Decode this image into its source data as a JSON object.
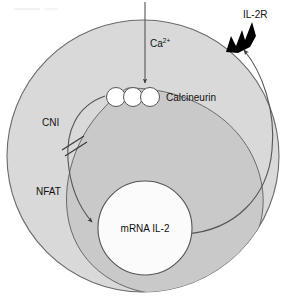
{
  "figure": {
    "background_color": "#ffffff",
    "line_color": "#555555",
    "text_color": "#111111"
  },
  "cell": {
    "name": "T lymphocyte",
    "cytoplasm_outer_color": "#d9d9d9",
    "cytoplasm_inner_color": "#c9c9c9",
    "membrane_color": "#6a6a6a"
  },
  "nucleus": {
    "label": "mRNA IL-2",
    "fill_color": "#fbfbfb",
    "border_color": "#555555"
  },
  "labels": {
    "calcium": "Ca",
    "calcium_superscript": "2+",
    "calcineurin": "Calcineurin",
    "cni": "CNI",
    "nfat": "NFAT",
    "il2r": "IL-2R"
  },
  "elements": {
    "calcineurin_subunit_count": 3,
    "calcineurin_subunit_fill": "#ffffff",
    "calcium_arrow": "downward arrow into cytoplasm",
    "nfat_arrow": "curved arrow from calcineurin down to nucleus",
    "inhibition_marker": "double slash across NFAT arrow",
    "il2_export_arrow": "curved arrow from nucleus to IL-2 receptor",
    "il2r_arrowhead_fill": "#000000"
  }
}
